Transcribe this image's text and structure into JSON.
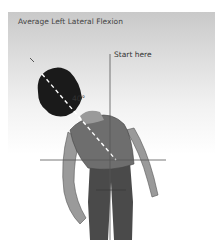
{
  "figure": {
    "title": "Average Left Lateral Flexion",
    "start_label": "Start here",
    "angle_label": "40°",
    "colors": {
      "background_top": "#c9c9c9",
      "background_bottom": "#ffffff",
      "hair": "#1a1a1a",
      "skin": "#9a9a9a",
      "top": "#6e6e6e",
      "pants": "#4a4a4a",
      "reference_line": "#555555",
      "spine_dashes": "#ffffff"
    },
    "icons": {
      "figure": "person-lateral-flexion-illustration"
    }
  }
}
